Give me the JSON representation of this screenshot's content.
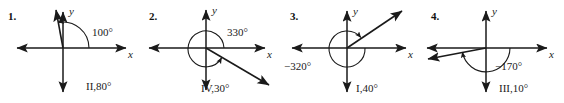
{
  "figure": {
    "type": "math-angle-diagrams",
    "panel_count": 4,
    "ink_color": "#1a1a1a",
    "background_color": "#ffffff"
  },
  "panels": [
    {
      "number": "1.",
      "x_axis_label": "x",
      "y_axis_label": "y",
      "angle_label": "100°",
      "answer_label": "II,80°",
      "terminal_ray_degrees": 100,
      "arc_direction": "counterclockwise",
      "arc_sweep_degrees": 100
    },
    {
      "number": "2.",
      "x_axis_label": "x",
      "y_axis_label": "y",
      "angle_label": "330°",
      "answer_label": "IV,30°",
      "terminal_ray_degrees": -30,
      "arc_direction": "counterclockwise",
      "arc_sweep_degrees": 330
    },
    {
      "number": "3.",
      "x_axis_label": "x",
      "y_axis_label": "y",
      "angle_label": "−320°",
      "answer_label": "I,40°",
      "terminal_ray_degrees": 40,
      "arc_direction": "clockwise",
      "arc_sweep_degrees": 320
    },
    {
      "number": "4.",
      "x_axis_label": "x",
      "y_axis_label": "y",
      "angle_label": "−170°",
      "answer_label": "III,10°",
      "terminal_ray_degrees": 190,
      "arc_direction": "clockwise",
      "arc_sweep_degrees": 170
    }
  ]
}
